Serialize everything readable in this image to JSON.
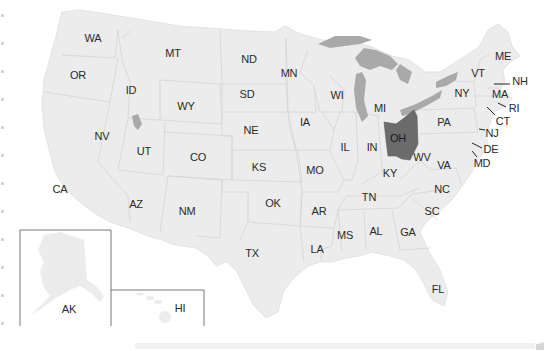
{
  "map": {
    "title": "United States",
    "highlighted_state": "OH",
    "colors": {
      "state_fill": "#ececec",
      "state_border": "#d2d2d2",
      "highlight_fill": "#6b6b6b",
      "water_fill": "#a9a9a9",
      "label": "#2a2a2a",
      "inset_border": "#555555"
    },
    "states": [
      {
        "code": "WA",
        "x": 93,
        "y": 38
      },
      {
        "code": "OR",
        "x": 78,
        "y": 75
      },
      {
        "code": "ID",
        "x": 131,
        "y": 90
      },
      {
        "code": "MT",
        "x": 173,
        "y": 53
      },
      {
        "code": "WY",
        "x": 186,
        "y": 106
      },
      {
        "code": "NV",
        "x": 102,
        "y": 136
      },
      {
        "code": "UT",
        "x": 144,
        "y": 151
      },
      {
        "code": "CO",
        "x": 198,
        "y": 157
      },
      {
        "code": "CA",
        "x": 60,
        "y": 189
      },
      {
        "code": "AZ",
        "x": 136,
        "y": 204
      },
      {
        "code": "NM",
        "x": 187,
        "y": 211
      },
      {
        "code": "ND",
        "x": 249,
        "y": 59
      },
      {
        "code": "SD",
        "x": 247,
        "y": 94
      },
      {
        "code": "NE",
        "x": 251,
        "y": 130
      },
      {
        "code": "KS",
        "x": 259,
        "y": 167
      },
      {
        "code": "OK",
        "x": 273,
        "y": 203
      },
      {
        "code": "TX",
        "x": 252,
        "y": 253
      },
      {
        "code": "MN",
        "x": 289,
        "y": 73
      },
      {
        "code": "IA",
        "x": 305,
        "y": 122
      },
      {
        "code": "MO",
        "x": 315,
        "y": 170
      },
      {
        "code": "AR",
        "x": 319,
        "y": 211
      },
      {
        "code": "LA",
        "x": 317,
        "y": 249
      },
      {
        "code": "WI",
        "x": 337,
        "y": 95
      },
      {
        "code": "IL",
        "x": 345,
        "y": 147
      },
      {
        "code": "MS",
        "x": 345,
        "y": 235
      },
      {
        "code": "MI",
        "x": 380,
        "y": 108
      },
      {
        "code": "IN",
        "x": 372,
        "y": 147
      },
      {
        "code": "OH",
        "x": 398,
        "y": 138
      },
      {
        "code": "KY",
        "x": 390,
        "y": 173
      },
      {
        "code": "TN",
        "x": 369,
        "y": 197
      },
      {
        "code": "AL",
        "x": 376,
        "y": 231
      },
      {
        "code": "GA",
        "x": 408,
        "y": 232
      },
      {
        "code": "FL",
        "x": 438,
        "y": 289
      },
      {
        "code": "SC",
        "x": 432,
        "y": 211
      },
      {
        "code": "NC",
        "x": 442,
        "y": 189
      },
      {
        "code": "WV",
        "x": 422,
        "y": 157
      },
      {
        "code": "VA",
        "x": 444,
        "y": 165
      },
      {
        "code": "PA",
        "x": 444,
        "y": 122
      },
      {
        "code": "NY",
        "x": 462,
        "y": 93
      },
      {
        "code": "VT",
        "x": 478,
        "y": 73
      },
      {
        "code": "ME",
        "x": 503,
        "y": 56
      },
      {
        "code": "NH",
        "x": 520,
        "y": 81
      },
      {
        "code": "MA",
        "x": 500,
        "y": 94
      },
      {
        "code": "RI",
        "x": 514,
        "y": 108
      },
      {
        "code": "CT",
        "x": 503,
        "y": 121
      },
      {
        "code": "NJ",
        "x": 492,
        "y": 133
      },
      {
        "code": "DE",
        "x": 491,
        "y": 149
      },
      {
        "code": "MD",
        "x": 482,
        "y": 163
      },
      {
        "code": "AK",
        "x": 69,
        "y": 309
      },
      {
        "code": "HI",
        "x": 180,
        "y": 308
      }
    ],
    "callouts": [
      {
        "code": "NH",
        "x1": 494,
        "y1": 84,
        "x2": 510,
        "y2": 84
      },
      {
        "code": "RI",
        "x1": 498,
        "y1": 103,
        "x2": 506,
        "y2": 107
      },
      {
        "code": "CT",
        "x1": 487,
        "y1": 107,
        "x2": 495,
        "y2": 115
      },
      {
        "code": "NJ",
        "x1": 479,
        "y1": 129,
        "x2": 485,
        "y2": 130
      },
      {
        "code": "DE",
        "x1": 472,
        "y1": 143,
        "x2": 482,
        "y2": 148
      },
      {
        "code": "MD",
        "x1": 472,
        "y1": 151,
        "x2": 477,
        "y2": 157
      }
    ],
    "insets": [
      {
        "name": "alaska-inset",
        "label": "AK"
      },
      {
        "name": "hawaii-inset",
        "label": "HI"
      }
    ]
  }
}
